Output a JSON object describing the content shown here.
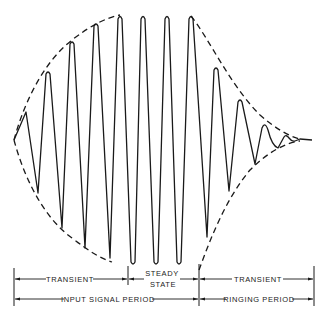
{
  "diagram": {
    "labels": {
      "row1": {
        "transient_left": "TRANSIENT",
        "steady_line1": "STEADY",
        "steady_line2": "STATE",
        "transient_right": "TRANSIENT"
      },
      "row2": {
        "input_signal_period": "INPUT SIGNAL PERIOD",
        "ringing_period": "RINGING PERIOD"
      }
    },
    "waveform": {
      "center_y": 140,
      "points": [
        [
          14,
          140
        ],
        [
          26,
          112
        ],
        [
          38,
          193
        ],
        [
          48,
          72
        ],
        [
          62,
          228
        ],
        [
          72,
          42
        ],
        [
          85,
          248
        ],
        [
          96,
          24
        ],
        [
          110,
          258
        ],
        [
          120,
          16
        ],
        [
          133,
          262
        ],
        [
          143,
          16
        ],
        [
          156,
          262
        ],
        [
          167,
          16
        ],
        [
          179,
          262
        ],
        [
          191,
          16
        ],
        [
          207,
          237
        ],
        [
          216,
          68
        ],
        [
          229,
          191
        ],
        [
          240,
          100
        ],
        [
          255,
          164
        ],
        [
          265,
          126
        ],
        [
          278,
          148
        ],
        [
          286,
          136
        ],
        [
          293,
          142
        ],
        [
          299,
          139
        ],
        [
          310,
          140
        ]
      ]
    },
    "envelope": {
      "style": "dashed",
      "upper": "growing to steady amplitude then decaying",
      "lower": "mirror of upper"
    },
    "dimension_marks_x": [
      14,
      128,
      199,
      314
    ]
  }
}
